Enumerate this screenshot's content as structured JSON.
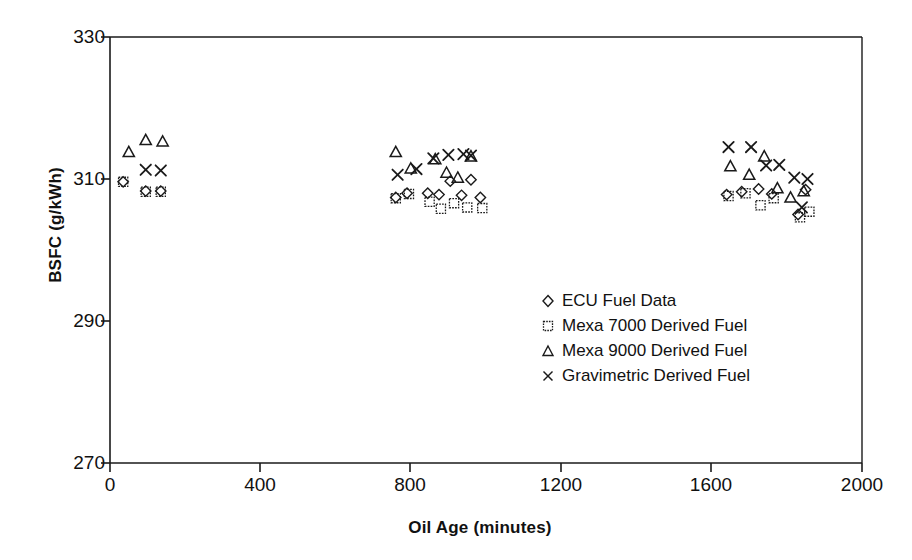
{
  "chart_data": {
    "type": "scatter",
    "title": "",
    "xlabel": "Oil Age (minutes)",
    "ylabel": "BSFC (g/kWh)",
    "xlim": [
      0,
      2000
    ],
    "ylim": [
      270,
      330
    ],
    "xticks": [
      0,
      400,
      800,
      1200,
      1600,
      2000
    ],
    "yticks": [
      270,
      290,
      310,
      330
    ],
    "grid": false,
    "legend_position": "center",
    "series": [
      {
        "name": "ECU Fuel Data",
        "marker": "diamond",
        "points": [
          [
            35,
            309.6
          ],
          [
            95,
            308.3
          ],
          [
            135,
            308.3
          ],
          [
            760,
            307.4
          ],
          [
            790,
            308.0
          ],
          [
            845,
            308.0
          ],
          [
            875,
            307.8
          ],
          [
            905,
            309.7
          ],
          [
            935,
            307.7
          ],
          [
            960,
            309.9
          ],
          [
            985,
            307.4
          ],
          [
            1640,
            307.8
          ],
          [
            1680,
            308.2
          ],
          [
            1725,
            308.6
          ],
          [
            1760,
            307.9
          ],
          [
            1830,
            305.0
          ],
          [
            1850,
            308.5
          ]
        ]
      },
      {
        "name": "Mexa 7000 Derived Fuel",
        "marker": "square",
        "points": [
          [
            35,
            309.6
          ],
          [
            95,
            308.2
          ],
          [
            135,
            308.2
          ],
          [
            760,
            307.3
          ],
          [
            795,
            307.9
          ],
          [
            850,
            306.8
          ],
          [
            880,
            305.8
          ],
          [
            915,
            306.6
          ],
          [
            950,
            306.0
          ],
          [
            990,
            305.9
          ],
          [
            1645,
            307.6
          ],
          [
            1690,
            308.0
          ],
          [
            1730,
            306.3
          ],
          [
            1765,
            307.3
          ],
          [
            1835,
            304.6
          ],
          [
            1860,
            305.4
          ]
        ]
      },
      {
        "name": "Mexa 9000 Derived Fuel",
        "marker": "triangle",
        "points": [
          [
            50,
            313.8
          ],
          [
            95,
            315.5
          ],
          [
            140,
            315.3
          ],
          [
            760,
            313.8
          ],
          [
            800,
            311.5
          ],
          [
            865,
            312.8
          ],
          [
            895,
            310.9
          ],
          [
            925,
            310.2
          ],
          [
            960,
            313.2
          ],
          [
            1650,
            311.8
          ],
          [
            1700,
            310.6
          ],
          [
            1740,
            313.2
          ],
          [
            1775,
            308.7
          ],
          [
            1810,
            307.4
          ],
          [
            1845,
            308.3
          ]
        ]
      },
      {
        "name": "Gravimetric Derived Fuel",
        "marker": "cross",
        "points": [
          [
            95,
            311.3
          ],
          [
            135,
            311.2
          ],
          [
            765,
            310.6
          ],
          [
            815,
            311.4
          ],
          [
            860,
            312.9
          ],
          [
            900,
            313.4
          ],
          [
            940,
            313.5
          ],
          [
            960,
            313.3
          ],
          [
            1645,
            314.5
          ],
          [
            1705,
            314.5
          ],
          [
            1745,
            311.9
          ],
          [
            1780,
            312.0
          ],
          [
            1820,
            310.2
          ],
          [
            1840,
            306.0
          ],
          [
            1855,
            310.0
          ]
        ]
      }
    ]
  },
  "axes": {
    "ylabel": "BSFC (g/kWh)",
    "xlabel": "Oil Age (minutes)",
    "ytick_labels": [
      "330",
      "310",
      "290",
      "270"
    ],
    "xtick_labels": [
      "0",
      "400",
      "800",
      "1200",
      "1600",
      "2000"
    ]
  },
  "legend": {
    "entries": [
      {
        "label": "ECU Fuel Data",
        "marker": "diamond-marker-icon"
      },
      {
        "label": "Mexa 7000 Derived Fuel",
        "marker": "square-marker-icon"
      },
      {
        "label": "Mexa 9000 Derived Fuel",
        "marker": "triangle-marker-icon"
      },
      {
        "label": "Gravimetric Derived Fuel",
        "marker": "cross-marker-icon"
      }
    ]
  },
  "colors": {
    "axis": "#1a1a1a",
    "marker": "#1a1a1a",
    "background": "#ffffff"
  }
}
